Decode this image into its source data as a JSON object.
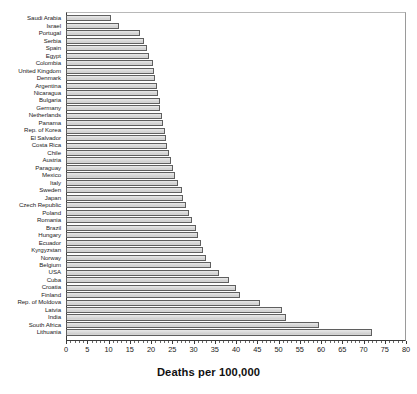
{
  "chart_data": {
    "type": "bar",
    "orientation": "horizontal",
    "title": "",
    "xlabel": "Deaths per 100,000",
    "ylabel": "",
    "xlim": [
      0,
      80
    ],
    "xticks": [
      0,
      5,
      10,
      15,
      20,
      25,
      30,
      35,
      40,
      45,
      50,
      55,
      60,
      65,
      70,
      75,
      80
    ],
    "xtick_labels": [
      "0",
      "5",
      "10",
      "15",
      "20",
      "25",
      "30",
      "35",
      "40",
      "45",
      "50",
      "55",
      "60",
      "65",
      "70",
      "75",
      "80"
    ],
    "minor_tick_step": 1,
    "grid": false,
    "legend": null,
    "bar_fill_color": "#dcdcdc",
    "bar_edge_color": "#5f5f5f",
    "axis_color": "#3a3a3a",
    "categories": [
      "Saudi Arabia",
      "Israel",
      "Portugal",
      "Serbia",
      "Spain",
      "Egypt",
      "Colombia",
      "United Kingdom",
      "Denmark",
      "Argentina",
      "Nicaragua",
      "Bulgaria",
      "Germany",
      "Netherlands",
      "Panama",
      "Rep. of Korea",
      "El Salvador",
      "Costa Rica",
      "Chile",
      "Austria",
      "Paraguay",
      "Mexico",
      "Italy",
      "Sweden",
      "Japan",
      "Czech Republic",
      "Poland",
      "Romania",
      "Brazil",
      "Hungary",
      "Ecuador",
      "Kyrgyzstan",
      "Norway",
      "Belgium",
      "USA",
      "Cuba",
      "Croatia",
      "Finland",
      "Rep. of Moldova",
      "Latvia",
      "India",
      "South Africa",
      "Lithuania"
    ],
    "values": [
      10.6,
      12.5,
      17.5,
      18.4,
      19.0,
      19.5,
      20.4,
      20.8,
      21.0,
      21.3,
      21.6,
      22.0,
      22.2,
      22.5,
      22.8,
      23.4,
      23.6,
      23.8,
      24.2,
      24.6,
      25.2,
      25.6,
      26.3,
      27.2,
      27.6,
      28.2,
      29.0,
      29.6,
      30.5,
      31.0,
      31.8,
      32.2,
      33.0,
      34.0,
      36.0,
      38.4,
      40.0,
      41.0,
      45.6,
      50.8,
      51.8,
      59.6,
      72.0
    ],
    "units": "Deaths per 100,000"
  }
}
